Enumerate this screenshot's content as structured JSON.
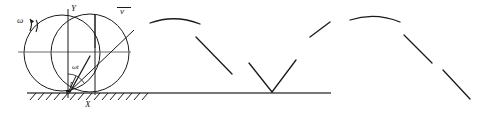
{
  "figure": {
    "stroke_color": "#1a1a1a",
    "background_color": "#ffffff",
    "axis_color": "#4a4a4a"
  },
  "labels": {
    "omega": "ω",
    "y_axis": "Y",
    "x_axis": "X",
    "velocity": "v",
    "angle": "ωt",
    "radius": "r"
  },
  "geometry": {
    "circle_radius": 38,
    "circle_a_center": [
      62,
      52
    ],
    "circle_b_center": [
      90,
      52
    ],
    "contact_point": [
      68,
      93
    ],
    "ground_line": {
      "x1": 27,
      "y1": 93,
      "x2": 330,
      "y2": 93
    },
    "hatch_count": 16,
    "hatch_start_x": 28,
    "hatch_end_x": 146,
    "y_axis_line": {
      "x1": 68,
      "y1": 10,
      "x2": 68,
      "y2": 97
    },
    "x_axis_line": {
      "x1": 27,
      "y1": 93,
      "x2": 145,
      "y2": 93
    },
    "centerline_a": {
      "x1": 20,
      "y1": 52,
      "x2": 130,
      "y2": 52
    },
    "radius_vector": {
      "x1": 68,
      "y1": 93,
      "x2": 133,
      "y2": 31
    },
    "vertical_chord": {
      "x1": 95,
      "y1": 16,
      "x2": 95,
      "y2": 95
    },
    "cycloid_arch_count": 3,
    "cycloid_period": 120,
    "cycloid_height": 76
  },
  "cycloid_segments": [
    {
      "name": "arch-1-left-rise",
      "d": "M 68 93 L 88 57"
    },
    {
      "name": "arch-1-crest",
      "d": "M 110 27 Q 140 12 170 27"
    },
    {
      "name": "arch-1-right-fall",
      "d": "M 188 55 L 210 88"
    },
    {
      "name": "arch-2-left-rise",
      "d": "M 228 57 L 250 88"
    },
    {
      "name": "arch-2-cusp-rise",
      "d": "M 268 92 L 288 58"
    },
    {
      "name": "arch-2-crest",
      "d": "M 305 30 Q 340 12 375 30"
    },
    {
      "name": "arch-2-right-fall",
      "d": "M 393 58 L 415 90"
    },
    {
      "name": "arch-3-tail",
      "d": "M 432 66 L 460 104"
    }
  ]
}
